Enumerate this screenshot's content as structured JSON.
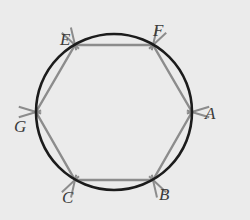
{
  "figure": {
    "name": "circle-with-inscribed-hexagon",
    "background_color": "#ebebeb",
    "circle": {
      "name": "circumscribed-circle",
      "center_x": 114,
      "center_y": 112,
      "radius": 78,
      "stroke_color": "#1c1c1c",
      "stroke_width": 2.6,
      "fill": "none"
    },
    "polygon": {
      "name": "inscribed-hexagon",
      "sides": 6,
      "stroke_color": "#8c8c8c",
      "stroke_width": 2.4,
      "fill": "none",
      "vertices": [
        {
          "label": "A",
          "x": 192,
          "y": 112
        },
        {
          "label": "B",
          "x": 153,
          "y": 180
        },
        {
          "label": "C",
          "x": 75,
          "y": 180
        },
        {
          "label": "G",
          "x": 36,
          "y": 112
        },
        {
          "label": "E",
          "x": 75,
          "y": 45
        },
        {
          "label": "F",
          "x": 153,
          "y": 45
        }
      ]
    },
    "tick_marks": {
      "name": "congruence-tick-marks",
      "stroke_color": "#8c8c8c",
      "stroke_width": 2.0,
      "length": 18,
      "count_per_vertex": 2,
      "spread_degrees": 34
    },
    "labels": [
      {
        "text": "F",
        "x": 153,
        "y": 22
      },
      {
        "text": "E",
        "x": 60,
        "y": 31
      },
      {
        "text": "A",
        "x": 205,
        "y": 105
      },
      {
        "text": "G",
        "x": 14,
        "y": 118
      },
      {
        "text": "B",
        "x": 159,
        "y": 186
      },
      {
        "text": "C",
        "x": 62,
        "y": 189
      }
    ]
  }
}
